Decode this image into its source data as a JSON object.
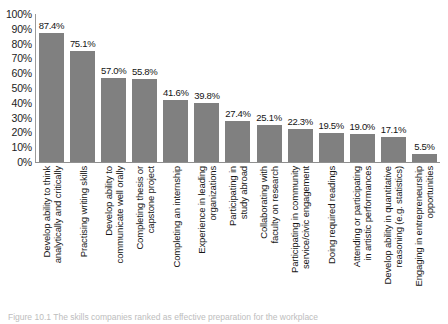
{
  "chart_data": {
    "type": "bar",
    "title": "",
    "xlabel": "",
    "ylabel": "",
    "ylim": [
      0,
      100
    ],
    "grid": false,
    "legend": null,
    "orientation": "vertical",
    "bar_color": "#808080",
    "value_label_suffix": "%",
    "ytick_labels": [
      "100%",
      "90%",
      "80%",
      "70%",
      "60%",
      "50%",
      "40%",
      "30%",
      "20%",
      "10%",
      "0%"
    ],
    "ytick_values": [
      100,
      90,
      80,
      70,
      60,
      50,
      40,
      30,
      20,
      10,
      0
    ],
    "categories": [
      "Develop ability to think\nanalytically and critically",
      "Practising writing skills",
      "Develop ability to\ncommunicate well orally",
      "Completing thesis or\ncapstone project",
      "Completing an internship",
      "Experience in leading\norganizations",
      "Participating in\nstudy abroad",
      "Collaborating with\nfaculty on research",
      "Participating in community\nservice/civic engagement",
      "Doing required readings",
      "Attending or participating\nin artistic performances",
      "Develop ability in quantitative\nreasoning (e.g. statistics)",
      "Engaging in entrepreneurship\nopportunities"
    ],
    "values": [
      87.4,
      75.1,
      57.0,
      55.8,
      41.6,
      39.8,
      27.4,
      25.1,
      22.3,
      19.5,
      19.0,
      17.1,
      5.5
    ],
    "value_labels": [
      "87.4%",
      "75.1%",
      "57.0%",
      "55.8%",
      "41.6%",
      "39.8%",
      "27.4%",
      "25.1%",
      "22.3%",
      "19.5%",
      "19.0%",
      "17.1%",
      "5.5%"
    ]
  },
  "caption": {
    "text": "Figure 10.1  The skills companies ranked as effective preparation for the workplace"
  }
}
